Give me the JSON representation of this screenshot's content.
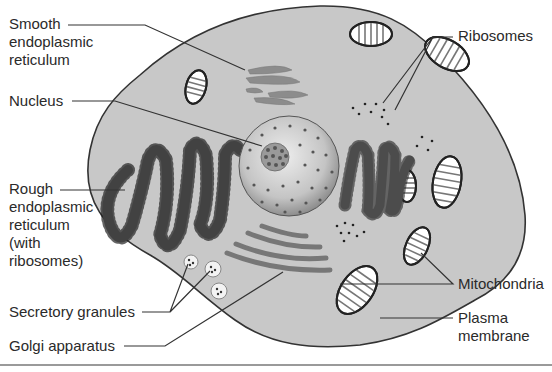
{
  "figure": {
    "colors": {
      "cytoplasm": "#c8c8c8",
      "outline": "#333333",
      "organelle_fill": "#8c8c8c",
      "nucleus_light": "#e6e6e6",
      "nucleus_dark": "#9a9a9a",
      "leader_line": "#333333",
      "text": "#2a2a2a",
      "bottom_rule": "#9a9a9a"
    }
  },
  "labels": {
    "smooth_er": "Smooth\nendoplasmic\nreticulum",
    "nucleus": "Nucleus",
    "rough_er": "Rough\nendoplasmic\nreticulum\n(with\nribosomes)",
    "secretory_granules": "Secretory granules",
    "golgi": "Golgi apparatus",
    "ribosomes": "Ribosomes",
    "mitochondria": "Mitochondria",
    "plasma_membrane": "Plasma\nmembrane"
  }
}
